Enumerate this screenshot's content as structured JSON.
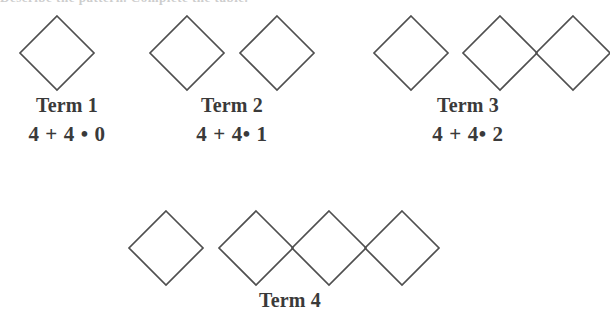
{
  "figure": {
    "title_clipped_fragment": "Describe the pattern. Complete the table.",
    "shape_name": "diamond",
    "stroke_color": "#4f4f4f",
    "background_color": "#ffffff",
    "operator_dot": "•",
    "terms": [
      {
        "id": "term-1",
        "label": "Term 1",
        "formula": "4 + 4 • 0",
        "diamond_count": 1,
        "groups": [
          1
        ],
        "label_center_x": 67,
        "label_y": 94,
        "formula_y": 122
      },
      {
        "id": "term-2",
        "label": "Term 2",
        "formula": "4 + 4• 1",
        "diamond_count": 2,
        "groups": [
          1,
          1
        ],
        "label_center_x": 232,
        "label_y": 94,
        "formula_y": 122
      },
      {
        "id": "term-3",
        "label": "Term 3",
        "formula": "4 + 4• 2",
        "diamond_count": 3,
        "groups": [
          1,
          2
        ],
        "label_center_x": 468,
        "label_y": 94,
        "formula_y": 122
      },
      {
        "id": "term-4",
        "label": "Term 4",
        "formula": "",
        "diamond_count": 4,
        "groups": [
          1,
          3
        ],
        "label_center_x": 290,
        "label_y": 289,
        "formula_y": 0
      }
    ],
    "rows": [
      {
        "id": "row-top",
        "diamond_top_y": 16,
        "diamond_size": 75,
        "diamonds": [
          {
            "cx": 57,
            "cy": 53,
            "term": 1
          },
          {
            "cx": 187,
            "cy": 53,
            "term": 2
          },
          {
            "cx": 277,
            "cy": 53,
            "term": 2
          },
          {
            "cx": 411,
            "cy": 53,
            "term": 3
          },
          {
            "cx": 500,
            "cy": 53,
            "term": 3
          },
          {
            "cx": 573,
            "cy": 53,
            "term": 3
          }
        ]
      },
      {
        "id": "row-bottom",
        "diamond_top_y": 211,
        "diamond_size": 75,
        "diamonds": [
          {
            "cx": 166,
            "cy": 248,
            "term": 4
          },
          {
            "cx": 256,
            "cy": 248,
            "term": 4
          },
          {
            "cx": 329,
            "cy": 248,
            "term": 4
          },
          {
            "cx": 402,
            "cy": 248,
            "term": 4
          }
        ]
      }
    ]
  }
}
